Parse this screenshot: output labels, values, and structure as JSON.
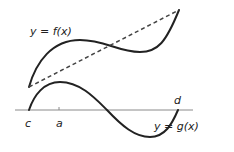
{
  "diagram": {
    "labels": {
      "f_curve": "y = f(x)",
      "g_curve": "y = g(x)",
      "point_c": "c",
      "point_a": "a",
      "point_d": "d"
    },
    "colors": {
      "curve": "#222222",
      "axis": "#888888",
      "dashed": "#444444"
    }
  }
}
